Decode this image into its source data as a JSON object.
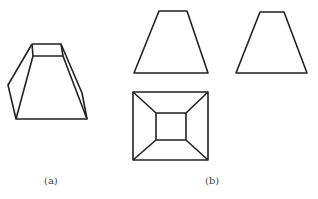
{
  "figure": {
    "labels": {
      "a": "(a)",
      "b": "(b)"
    },
    "stroke_color": "#222222",
    "shapes": {
      "perspective_view": {
        "description": "frustum of a square pyramid, 3D view",
        "polylines": [
          [
            [
              32,
              44
            ],
            [
              61,
              44
            ],
            [
              82,
              93
            ],
            [
              87,
              119
            ],
            [
              16,
              119
            ],
            [
              8,
              85
            ],
            [
              32,
              44
            ]
          ],
          [
            [
              32,
              44
            ],
            [
              33,
              56
            ],
            [
              63,
              56
            ],
            [
              61,
              44
            ]
          ],
          [
            [
              33,
              56
            ],
            [
              16,
              119
            ]
          ],
          [
            [
              63,
              56
            ],
            [
              87,
              119
            ]
          ]
        ]
      },
      "front_view": {
        "polygon": [
          [
            159,
            11
          ],
          [
            187,
            11
          ],
          [
            208,
            73
          ],
          [
            134,
            73
          ]
        ]
      },
      "side_view": {
        "polygon": [
          [
            260,
            12
          ],
          [
            284,
            12
          ],
          [
            307,
            73
          ],
          [
            236,
            73
          ]
        ]
      },
      "top_view": {
        "outer": [
          [
            133,
            92
          ],
          [
            208,
            92
          ],
          [
            208,
            160
          ],
          [
            133,
            160
          ]
        ],
        "inner": [
          [
            156,
            113
          ],
          [
            186,
            113
          ],
          [
            186,
            140
          ],
          [
            156,
            140
          ]
        ]
      }
    }
  }
}
